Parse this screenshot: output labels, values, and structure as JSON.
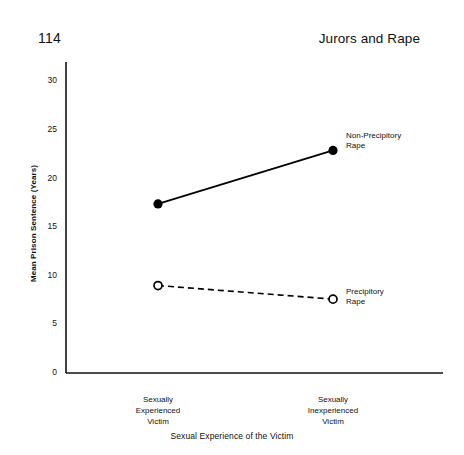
{
  "page": {
    "number": "114",
    "running_head": "Jurors and Rape"
  },
  "chart_data": {
    "type": "line",
    "title": "",
    "xlabel": "Sexual Experience of the Victim",
    "ylabel": "Mean Prison Sentence (Years)",
    "categories": [
      "Sexually Experienced Victim",
      "Sexually Inexperienced Victim"
    ],
    "category_lines": [
      [
        "Sexually",
        "Experienced",
        "Victim"
      ],
      [
        "Sexually",
        "Inexperienced",
        "Victim"
      ]
    ],
    "ylim": [
      0,
      32
    ],
    "yticks": [
      0,
      5,
      10,
      15,
      20,
      25,
      30
    ],
    "ytick_labels": [
      "0",
      "5",
      "10",
      "15",
      "20",
      "25",
      "30"
    ],
    "grid": false,
    "legend": "inline-right",
    "series": [
      {
        "name": "Non-Precipitory Rape",
        "name_lines": [
          "Non-Precipitory",
          "Rape"
        ],
        "values": [
          17.4,
          22.9
        ],
        "linestyle": "solid",
        "marker": "filled-circle",
        "color": "#000000"
      },
      {
        "name": "Precipitory Rape",
        "name_lines": [
          "Precipitory",
          "Rape"
        ],
        "values": [
          9.0,
          7.6
        ],
        "linestyle": "dashed",
        "marker": "open-circle",
        "color": "#000000"
      }
    ]
  },
  "axis_geometry": {
    "x_left_px": 66,
    "x_right_px": 443,
    "y_top_px": 62,
    "y_zero_px": 373,
    "cat_x_px": [
      158,
      333
    ]
  }
}
